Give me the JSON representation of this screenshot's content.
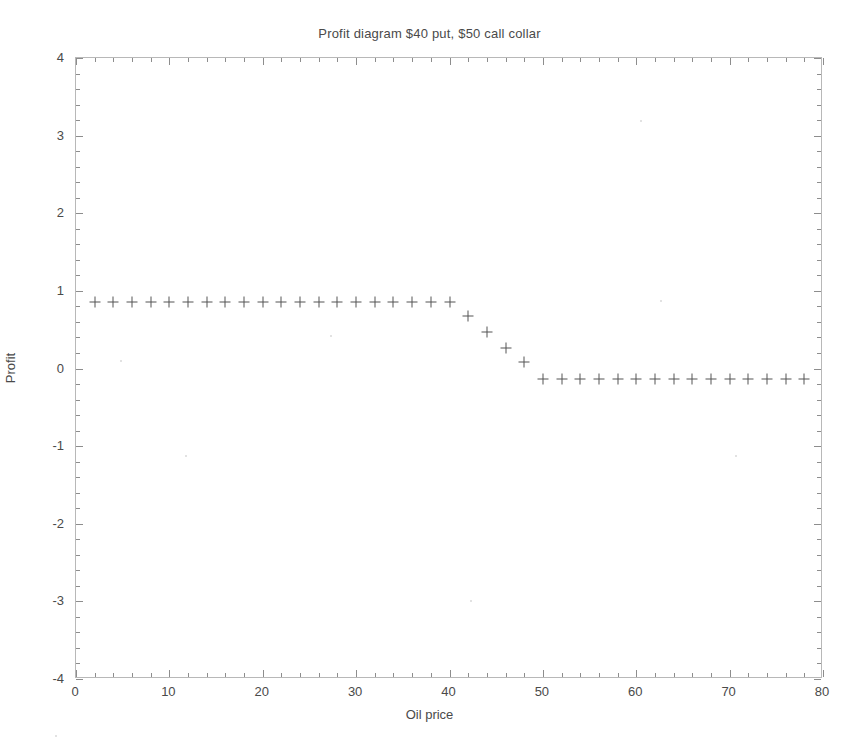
{
  "chart_data": {
    "type": "scatter",
    "title": "Profit diagram $40 put, $50 call collar",
    "xlabel": "Oil price",
    "ylabel": "Profit",
    "xlim": [
      0,
      80
    ],
    "ylim": [
      -4,
      4
    ],
    "grid": false,
    "legend": null,
    "marker": "+",
    "marker_color": "#555555",
    "xticks": [
      0,
      10,
      20,
      30,
      40,
      50,
      60,
      70,
      80
    ],
    "xtick_labels": [
      "0",
      "10",
      "20",
      "30",
      "40",
      "50",
      "60",
      "70",
      "80"
    ],
    "yticks": [
      -4,
      -3,
      -2,
      -1,
      0,
      1,
      2,
      3,
      4
    ],
    "ytick_labels": [
      "-4",
      "-3",
      "-2",
      "-1",
      "0",
      "1",
      "2",
      "3",
      "4"
    ],
    "x": [
      2,
      4,
      6,
      8,
      10,
      12,
      14,
      16,
      18,
      20,
      22,
      24,
      26,
      28,
      30,
      32,
      34,
      36,
      38,
      40,
      42,
      44,
      46,
      48,
      50,
      52,
      54,
      56,
      58,
      60,
      62,
      64,
      66,
      68,
      70,
      72,
      74,
      76,
      78
    ],
    "values": [
      0.86,
      0.86,
      0.86,
      0.86,
      0.86,
      0.86,
      0.86,
      0.86,
      0.86,
      0.86,
      0.86,
      0.86,
      0.86,
      0.86,
      0.86,
      0.86,
      0.86,
      0.86,
      0.86,
      0.86,
      0.67,
      0.47,
      0.26,
      0.08,
      -0.13,
      -0.13,
      -0.13,
      -0.13,
      -0.13,
      -0.13,
      -0.13,
      -0.13,
      -0.13,
      -0.13,
      -0.13,
      -0.13,
      -0.13,
      -0.13,
      -0.13
    ],
    "annotations": []
  },
  "axes": {
    "title_text": "Profit diagram $40 put, $50 call collar",
    "x_axis_label": "Oil price",
    "y_axis_label": "Profit"
  }
}
